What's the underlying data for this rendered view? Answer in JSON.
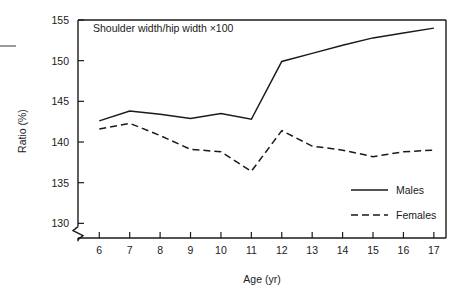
{
  "figure": {
    "panel_title": "Shoulder width/hip width ×100",
    "y_axis_title": "Ratio (%)",
    "x_axis_title": "Age (yr)",
    "axis_break": true
  },
  "legend": {
    "position": "bottom-right",
    "entries": [
      {
        "label": "Males",
        "style": "solid"
      },
      {
        "label": "Females",
        "style": "dashed"
      }
    ]
  },
  "chart_data": {
    "type": "line",
    "title": "Shoulder width/hip width ×100",
    "xlabel": "Age (yr)",
    "ylabel": "Ratio (%)",
    "x": [
      6,
      7,
      8,
      9,
      10,
      11,
      12,
      13,
      14,
      15,
      16,
      17
    ],
    "xlim": [
      5.3,
      17.4
    ],
    "ylim": [
      128.2,
      155.0
    ],
    "xticks": [
      "6",
      "7",
      "8",
      "9",
      "10",
      "11",
      "12",
      "13",
      "14",
      "15",
      "16",
      "17"
    ],
    "yticks": [
      "130",
      "135",
      "140",
      "145",
      "150",
      "155"
    ],
    "grid": false,
    "legend_position": "bottom-right",
    "axis_break_y_below": 130,
    "series": [
      {
        "name": "Males",
        "style": "solid",
        "values": [
          142.6,
          143.8,
          143.4,
          142.9,
          143.5,
          142.8,
          149.9,
          150.9,
          151.9,
          152.8,
          153.4,
          154.0
        ]
      },
      {
        "name": "Females",
        "style": "dashed",
        "values": [
          141.6,
          142.3,
          140.8,
          139.1,
          138.8,
          136.4,
          141.4,
          139.5,
          139.0,
          138.2,
          138.8,
          139.0
        ]
      }
    ]
  }
}
